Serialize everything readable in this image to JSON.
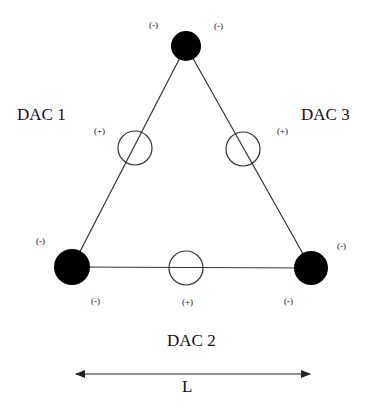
{
  "diagram": {
    "type": "triangular DAC electrode arrangement",
    "labels": {
      "dac1": "DAC 1",
      "dac2": "DAC 2",
      "dac3": "DAC 3",
      "length": "L"
    },
    "nodes": [
      {
        "id": "top",
        "kind": "filled",
        "polarity": "(-)",
        "cx": 186,
        "cy": 46,
        "r": 15
      },
      {
        "id": "bottom-left",
        "kind": "filled",
        "polarity": "(-)",
        "cx": 72,
        "cy": 267,
        "r": 18
      },
      {
        "id": "bottom-right",
        "kind": "filled",
        "polarity": "(-)",
        "cx": 311,
        "cy": 268,
        "r": 17
      }
    ],
    "open_circles": [
      {
        "id": "left-side",
        "polarity": "(+)",
        "cx": 135,
        "cy": 148,
        "r": 17
      },
      {
        "id": "right-side",
        "polarity": "(+)",
        "cx": 243,
        "cy": 149,
        "r": 17
      },
      {
        "id": "bottom-side",
        "polarity": "(+)",
        "cx": 186,
        "cy": 268,
        "r": 17
      }
    ],
    "signs": {
      "top_left": "(-)",
      "top_right": "(-)",
      "left_plus": "(+)",
      "right_plus": "(+)",
      "bl_upper": "(-)",
      "bl_lower": "(-)",
      "br_upper": "(-)",
      "br_lower": "(-)",
      "bottom_plus": "(+)"
    },
    "colors": {
      "line": "#333333",
      "fill": "#000000",
      "background": "#ffffff"
    }
  }
}
